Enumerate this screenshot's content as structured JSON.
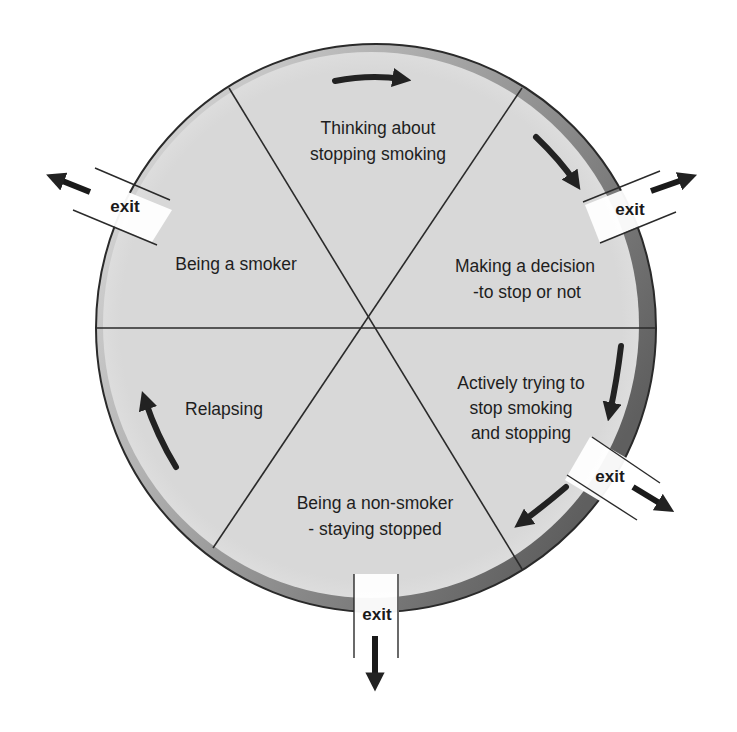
{
  "diagram": {
    "type": "cycle",
    "stages": [
      {
        "id": "thinking",
        "lines": [
          "Thinking about",
          "stopping smoking"
        ]
      },
      {
        "id": "deciding",
        "lines": [
          "Making a decision",
          "-to stop or not"
        ]
      },
      {
        "id": "trying",
        "lines": [
          "Actively trying to",
          "stop smoking",
          "and stopping"
        ]
      },
      {
        "id": "non-smoker",
        "lines": [
          "Being a non-smoker",
          "- staying stopped"
        ]
      },
      {
        "id": "relapsing",
        "lines": [
          "Relapsing"
        ]
      },
      {
        "id": "smoker",
        "lines": [
          "Being a smoker"
        ]
      }
    ],
    "exits": [
      {
        "from": "smoker",
        "label": "exit"
      },
      {
        "from": "deciding",
        "label": "exit"
      },
      {
        "from": "trying",
        "label": "exit"
      },
      {
        "from": "non-smoker",
        "label": "exit"
      }
    ],
    "direction": "clockwise",
    "colors": {
      "fill": "#d9d9d9",
      "rim_light": "#c8c8c8",
      "rim_dark": "#6e6e6e",
      "lines": "#2a2a2a",
      "arrows": "#222222"
    }
  }
}
